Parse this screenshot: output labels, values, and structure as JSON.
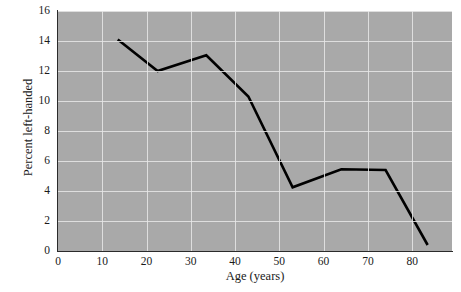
{
  "chart_data": {
    "type": "line",
    "title": "",
    "xlabel": "Age (years)",
    "ylabel": "Percent left-handed",
    "xlim": [
      0,
      89
    ],
    "ylim": [
      0,
      16
    ],
    "grid": true,
    "legend": "none",
    "xticks": [
      0,
      10,
      20,
      30,
      40,
      50,
      60,
      70,
      80
    ],
    "yticks": [
      0,
      2,
      4,
      6,
      8,
      10,
      12,
      14,
      16
    ],
    "series": [
      {
        "name": "Percent left-handed",
        "color": "#000000",
        "x": [
          13.5,
          22.5,
          33.5,
          43.0,
          53.0,
          64.0,
          74.0,
          83.5
        ],
        "values": [
          14.1,
          12.0,
          13.05,
          10.3,
          4.25,
          5.45,
          5.4,
          0.4
        ]
      }
    ],
    "points": [
      {
        "age": 13.5,
        "percent": 14.1
      },
      {
        "age": 22.5,
        "percent": 12.0
      },
      {
        "age": 33.5,
        "percent": 13.05
      },
      {
        "age": 43.0,
        "percent": 10.3
      },
      {
        "age": 53.0,
        "percent": 4.25
      },
      {
        "age": 64.0,
        "percent": 5.45
      },
      {
        "age": 74.0,
        "percent": 5.4
      },
      {
        "age": 83.5,
        "percent": 0.4
      }
    ],
    "plot_background": "#a9a9a9",
    "grid_color": "#e8e8e8",
    "axis_color": "#2b2b2b"
  },
  "caption": {
    "text": ""
  }
}
